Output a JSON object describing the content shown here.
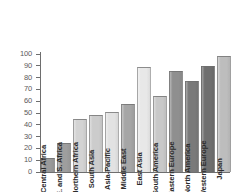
{
  "chart_data": {
    "type": "bar",
    "title": "",
    "subtitle": "",
    "xlabel": "",
    "ylabel": "",
    "ylim": [
      0,
      100
    ],
    "yticks": [
      0,
      10,
      20,
      30,
      40,
      50,
      60,
      70,
      80,
      90,
      100
    ],
    "grid": false,
    "legend": "none",
    "categories": [
      "Central Africa",
      "E. and S. Africa",
      "Northern Africa",
      "South Asia",
      "Asia-Pacific",
      "Middle East",
      "East Asia",
      "South America",
      "Eastern Europe",
      "North America",
      "Western Europe",
      "Japan"
    ],
    "values": [
      12,
      25,
      45,
      48,
      51,
      58,
      89,
      64,
      86,
      77,
      90,
      98
    ],
    "bar_colors": [
      "#9a9a9a",
      "#9e9e9e",
      "#d3d3d3",
      "#cccccc",
      "#e2e2e2",
      "#a6a6a6",
      "#e8e8e8",
      "#c8c8c8",
      "#8f8f8f",
      "#7a7a7a",
      "#6f6f6f",
      "#bdbdbd"
    ]
  },
  "axis": {
    "tick_labels": [
      "0",
      "10",
      "20",
      "30",
      "40",
      "50",
      "60",
      "70",
      "80",
      "90",
      "100"
    ],
    "axis_color": "#6e6e6e"
  }
}
